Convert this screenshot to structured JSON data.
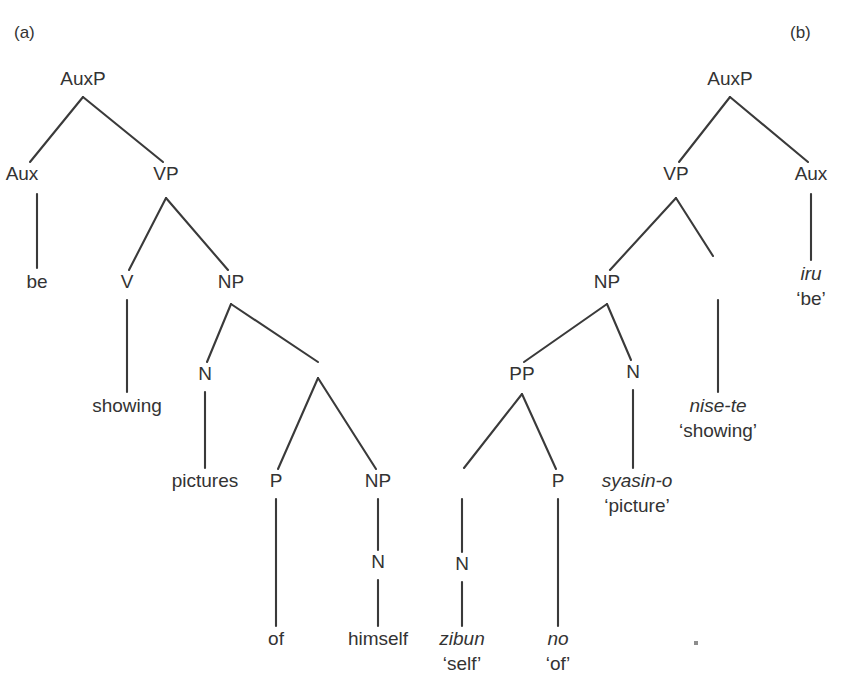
{
  "figure": {
    "background_color": "#ffffff",
    "ink_color": "#333333",
    "line_color": "#3a3a3a",
    "width": 841,
    "height": 689
  },
  "panels": [
    {
      "id": "a",
      "label": "(a)",
      "label_pos": {
        "x": 14,
        "y": 38
      },
      "language": "english",
      "nodes": [
        {
          "name": "auxp",
          "label": "AuxP",
          "x": 83,
          "y": 85,
          "type": "category"
        },
        {
          "name": "aux",
          "label": "Aux",
          "x": 22,
          "y": 180,
          "type": "category"
        },
        {
          "name": "vp",
          "label": "VP",
          "x": 166,
          "y": 180,
          "type": "category"
        },
        {
          "name": "be",
          "label": "be",
          "x": 37,
          "y": 288,
          "type": "leaf"
        },
        {
          "name": "v",
          "label": "V",
          "x": 127,
          "y": 288,
          "type": "category"
        },
        {
          "name": "np1",
          "label": "NP",
          "x": 231,
          "y": 288,
          "type": "category"
        },
        {
          "name": "showing",
          "label": "showing",
          "x": 127,
          "y": 412,
          "type": "leaf"
        },
        {
          "name": "n1",
          "label": "N",
          "x": 205,
          "y": 380,
          "type": "category"
        },
        {
          "name": "pictures",
          "label": "pictures",
          "x": 205,
          "y": 487,
          "type": "leaf"
        },
        {
          "name": "p",
          "label": "P",
          "x": 276,
          "y": 487,
          "type": "category"
        },
        {
          "name": "np2",
          "label": "NP",
          "x": 378,
          "y": 487,
          "type": "category"
        },
        {
          "name": "n2",
          "label": "N",
          "x": 378,
          "y": 568,
          "type": "category"
        },
        {
          "name": "of",
          "label": "of",
          "x": 276,
          "y": 645,
          "type": "leaf"
        },
        {
          "name": "himself",
          "label": "himself",
          "x": 378,
          "y": 645,
          "type": "leaf"
        }
      ]
    },
    {
      "id": "b",
      "label": "(b)",
      "label_pos": {
        "x": 790,
        "y": 38
      },
      "language": "japanese",
      "nodes": [
        {
          "name": "auxp",
          "label": "AuxP",
          "x": 730,
          "y": 85,
          "type": "category"
        },
        {
          "name": "vp",
          "label": "VP",
          "x": 676,
          "y": 180,
          "type": "category"
        },
        {
          "name": "aux",
          "label": "Aux",
          "x": 811,
          "y": 180,
          "type": "category"
        },
        {
          "name": "np",
          "label": "NP",
          "x": 607,
          "y": 288,
          "type": "category"
        },
        {
          "name": "pp",
          "label": "PP",
          "x": 522,
          "y": 380,
          "type": "category"
        },
        {
          "name": "n-head",
          "label": "N",
          "x": 633,
          "y": 378,
          "type": "category"
        },
        {
          "name": "n-zibun",
          "label": "N",
          "x": 462,
          "y": 570,
          "type": "category"
        },
        {
          "name": "p-no",
          "label": "P",
          "x": 558,
          "y": 487,
          "type": "category"
        }
      ],
      "glossed_leaves": [
        {
          "name": "iru",
          "word": "iru",
          "gloss": "‘be’",
          "x": 811,
          "y": 280,
          "gloss_y": 305
        },
        {
          "name": "nise-te",
          "word": "nise-te",
          "gloss": "‘showing’",
          "x": 718,
          "y": 412,
          "gloss_y": 437
        },
        {
          "name": "syasin-o",
          "word": "syasin-o",
          "gloss": "‘picture’",
          "x": 637,
          "y": 487,
          "gloss_y": 512
        },
        {
          "name": "zibun",
          "word": "zibun",
          "gloss": "‘self’",
          "x": 462,
          "y": 645,
          "gloss_y": 670
        },
        {
          "name": "no",
          "word": "no",
          "gloss": "‘of’",
          "x": 558,
          "y": 645,
          "gloss_y": 670
        }
      ]
    }
  ],
  "edges": {
    "panel_a": [
      {
        "from": "auxp",
        "to": "aux",
        "x1": 83,
        "y1": 97,
        "x2": 30,
        "y2": 162
      },
      {
        "from": "auxp",
        "to": "vp",
        "x1": 83,
        "y1": 97,
        "x2": 163,
        "y2": 162
      },
      {
        "from": "aux",
        "to": "be",
        "x1": 37,
        "y1": 194,
        "x2": 37,
        "y2": 268
      },
      {
        "from": "vp",
        "to": "v",
        "x1": 166,
        "y1": 198,
        "x2": 129,
        "y2": 270
      },
      {
        "from": "vp",
        "to": "np1",
        "x1": 166,
        "y1": 198,
        "x2": 228,
        "y2": 270
      },
      {
        "from": "v",
        "to": "showing",
        "x1": 127,
        "y1": 300,
        "x2": 127,
        "y2": 392
      },
      {
        "from": "np1",
        "to": "n1",
        "x1": 231,
        "y1": 304,
        "x2": 207,
        "y2": 362
      },
      {
        "from": "np1",
        "to": "pp",
        "x1": 231,
        "y1": 304,
        "x2": 318,
        "y2": 362
      },
      {
        "from": "n1",
        "to": "pictures",
        "x1": 205,
        "y1": 392,
        "x2": 205,
        "y2": 468
      },
      {
        "from": "pp",
        "to": "p",
        "x1": 318,
        "y1": 378,
        "x2": 278,
        "y2": 469
      },
      {
        "from": "pp",
        "to": "np2",
        "x1": 318,
        "y1": 378,
        "x2": 376,
        "y2": 469
      },
      {
        "from": "p",
        "to": "of",
        "x1": 276,
        "y1": 499,
        "x2": 276,
        "y2": 626
      },
      {
        "from": "np2",
        "to": "n2",
        "x1": 378,
        "y1": 499,
        "x2": 378,
        "y2": 550
      },
      {
        "from": "n2",
        "to": "himself",
        "x1": 378,
        "y1": 580,
        "x2": 378,
        "y2": 626
      }
    ],
    "panel_b": [
      {
        "from": "auxp",
        "to": "vp",
        "x1": 730,
        "y1": 97,
        "x2": 679,
        "y2": 162
      },
      {
        "from": "auxp",
        "to": "aux",
        "x1": 730,
        "y1": 97,
        "x2": 808,
        "y2": 162
      },
      {
        "from": "aux",
        "to": "iru",
        "x1": 811,
        "y1": 194,
        "x2": 811,
        "y2": 260
      },
      {
        "from": "vp",
        "to": "np",
        "x1": 676,
        "y1": 198,
        "x2": 610,
        "y2": 270
      },
      {
        "from": "vp",
        "to": "nise-te",
        "x1": 676,
        "y1": 198,
        "x2": 713,
        "y2": 256
      },
      {
        "from": "stub",
        "to": "nise-te",
        "x1": 718,
        "y1": 300,
        "x2": 718,
        "y2": 392
      },
      {
        "from": "np",
        "to": "pp",
        "x1": 607,
        "y1": 304,
        "x2": 524,
        "y2": 362
      },
      {
        "from": "np",
        "to": "n-head",
        "x1": 607,
        "y1": 304,
        "x2": 631,
        "y2": 360
      },
      {
        "from": "pp",
        "to": "n-zibun",
        "x1": 522,
        "y1": 394,
        "x2": 464,
        "y2": 468
      },
      {
        "from": "pp",
        "to": "p-no",
        "x1": 522,
        "y1": 394,
        "x2": 556,
        "y2": 469
      },
      {
        "from": "n-head",
        "to": "syasin-o",
        "x1": 633,
        "y1": 390,
        "x2": 633,
        "y2": 468
      },
      {
        "from": "n-zibun",
        "to": "zibun",
        "x1": 462,
        "y1": 582,
        "x2": 462,
        "y2": 626
      },
      {
        "from": "p-no",
        "to": "no",
        "x1": 558,
        "y1": 499,
        "x2": 558,
        "y2": 626
      },
      {
        "from": "n-stub",
        "to": "n-zibun",
        "x1": 462,
        "y1": 499,
        "x2": 462,
        "y2": 552
      }
    ]
  },
  "artifact": {
    "name": "scan-speck",
    "x": 694,
    "y": 641,
    "w": 4,
    "h": 4
  }
}
